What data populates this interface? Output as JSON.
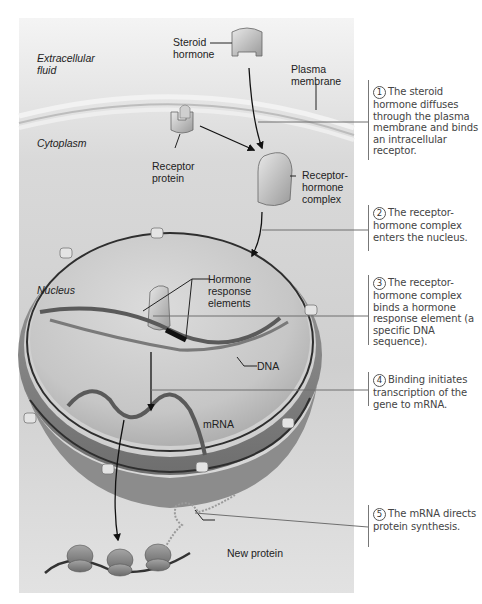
{
  "figure": {
    "regions": {
      "extracellular": "Extracellular\nfluid",
      "cytoplasm": "Cytoplasm",
      "nucleus": "Nucleus"
    },
    "labels": {
      "steroid_hormone": "Steroid\nhormone",
      "plasma_membrane": "Plasma\nmembrane",
      "receptor_protein": "Receptor\nprotein",
      "receptor_hormone_complex": "Receptor-\nhormone\ncomplex",
      "hormone_response_elements": "Hormone\nresponse\nelements",
      "dna": "DNA",
      "mrna": "mRNA",
      "new_protein": "New protein"
    },
    "steps": [
      {
        "number": "1",
        "text": "The steroid hormone diffuses through the plasma membrane and binds an intracellular receptor."
      },
      {
        "number": "2",
        "text": "The receptor-hormone complex enters the nucleus."
      },
      {
        "number": "3",
        "text": "The receptor-hormone complex binds a hormone response element (a specific DNA sequence)."
      },
      {
        "number": "4",
        "text": "Binding initiates transcription of the gene to mRNA."
      },
      {
        "number": "5",
        "text": "The mRNA directs protein synthesis."
      }
    ],
    "colors": {
      "panel": "#d6d6d6",
      "nucleus": "#c4c4c4",
      "envelope": "#8a8a8a",
      "text": "#222222",
      "step_text": "#444444"
    }
  }
}
